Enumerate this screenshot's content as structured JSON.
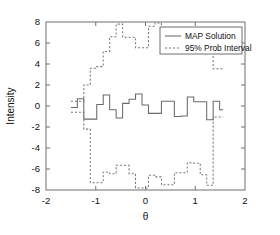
{
  "chart_data": {
    "type": "line",
    "title": "",
    "xlabel": "θ",
    "ylabel": "Intensity",
    "xlim": [
      -2,
      2
    ],
    "ylim": [
      -8,
      8
    ],
    "xticks": [
      -2,
      -1,
      0,
      1,
      2
    ],
    "xtick_labels": [
      "-2",
      "-1",
      "0",
      "1",
      "2"
    ],
    "yticks": [
      -8,
      -6,
      -4,
      -2,
      0,
      2,
      4,
      6,
      8
    ],
    "ytick_labels": [
      "-8",
      "-6",
      "-4",
      "-2",
      "0",
      "2",
      "4",
      "6",
      "8"
    ],
    "grid": false,
    "drawstyle": "steps-post",
    "legend_position": "upper right",
    "legend": [
      {
        "label": "MAP Solution",
        "style": "solid"
      },
      {
        "label": "95% Prob Interval",
        "style": "dashed"
      }
    ],
    "x_edges": [
      -1.5,
      -1.37,
      -1.24,
      -1.11,
      -0.98,
      -0.85,
      -0.72,
      -0.59,
      -0.46,
      -0.33,
      -0.2,
      -0.07,
      0.06,
      0.19,
      0.32,
      0.45,
      0.58,
      0.71,
      0.84,
      0.97,
      1.1,
      1.23,
      1.36,
      1.49,
      1.56
    ],
    "series": [
      {
        "name": "MAP Solution",
        "style": "solid",
        "values": [
          -0.15,
          0.7,
          -1.25,
          -1.25,
          0.15,
          1.05,
          -0.35,
          -1.15,
          0.25,
          0.65,
          1.15,
          0.1,
          -0.7,
          -0.7,
          0.45,
          0.45,
          -1.0,
          -0.95,
          0.85,
          0.4,
          0.4,
          -1.3,
          0.45,
          -0.35
        ]
      },
      {
        "name": "95% Prob Interval Upper",
        "style": "dashed",
        "values": [
          0.45,
          0.45,
          2.0,
          3.6,
          3.75,
          5.2,
          6.6,
          7.8,
          6.55,
          6.55,
          5.55,
          5.55,
          7.6,
          7.9,
          6.75,
          6.5,
          6.5,
          6.6,
          6.85,
          6.85,
          6.4,
          5.4,
          3.55,
          3.55
        ]
      },
      {
        "name": "95% Prob Interval Lower",
        "style": "dashed",
        "values": [
          -0.6,
          -0.6,
          -2.2,
          -7.3,
          -7.3,
          -6.3,
          -6.45,
          -5.65,
          -5.65,
          -6.45,
          -7.8,
          -7.8,
          -6.6,
          -6.75,
          -7.5,
          -7.5,
          -6.35,
          -6.35,
          -5.4,
          -5.45,
          -6.55,
          -7.55,
          -1.05,
          -1.05
        ]
      }
    ]
  }
}
